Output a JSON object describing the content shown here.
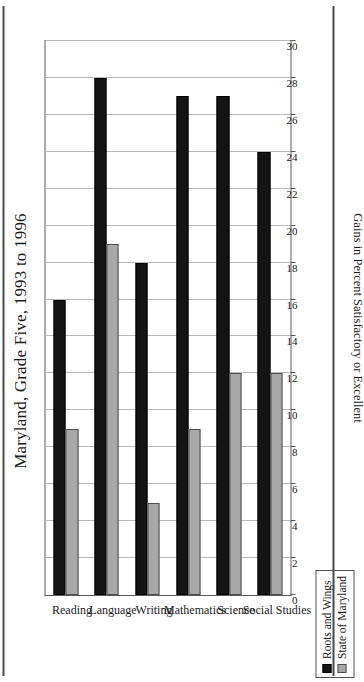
{
  "figure": {
    "title": "Maryland, Grade Five, 1993 to 1996",
    "title_partial_above": "",
    "orientation": "rotated-90-ccw",
    "rules": {
      "top": "horizontal-rule",
      "bottom": "horizontal-rule"
    }
  },
  "legend": {
    "position": "bottom-left",
    "items": [
      {
        "label": "Roots and Wings",
        "color": "#141414",
        "icon": "filled-square-icon"
      },
      {
        "label": "State of Maryland",
        "color": "#a8a8a8",
        "icon": "filled-square-icon"
      }
    ]
  },
  "axis": {
    "value_title": "Gains in Percent Satisfactory or Excellent",
    "ticks": [
      0,
      2,
      4,
      6,
      8,
      10,
      12,
      14,
      16,
      18,
      20,
      22,
      24,
      26,
      28,
      30
    ]
  },
  "chart_data": {
    "type": "bar",
    "title": "Maryland, Grade Five, 1993 to 1996",
    "xlabel": "",
    "ylabel": "Gains in Percent Satisfactory or Excellent",
    "ylim": [
      0,
      30
    ],
    "grid": true,
    "legend_position": "bottom-left",
    "orientation": "horizontal",
    "categories": [
      "Reading",
      "Language",
      "Writing",
      "Mathematics",
      "Science",
      "Social Studies"
    ],
    "series": [
      {
        "name": "Roots and Wings",
        "color": "#141414",
        "values": [
          16,
          28,
          18,
          27,
          27,
          24
        ]
      },
      {
        "name": "State of Maryland",
        "color": "#a8a8a8",
        "values": [
          9,
          19,
          5,
          9,
          12,
          12
        ]
      }
    ]
  }
}
